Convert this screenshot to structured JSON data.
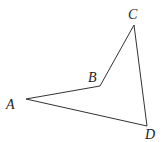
{
  "diagram": {
    "type": "quadrilateral",
    "stroke_color": "#333333",
    "vertices": [
      {
        "id": "A",
        "label": "A",
        "x": 26,
        "y": 99,
        "label_x": 6,
        "label_y": 109
      },
      {
        "id": "B",
        "label": "B",
        "x": 100,
        "y": 86,
        "label_x": 88,
        "label_y": 82
      },
      {
        "id": "C",
        "label": "C",
        "x": 134,
        "y": 25,
        "label_x": 128,
        "label_y": 19
      },
      {
        "id": "D",
        "label": "D",
        "x": 147,
        "y": 126,
        "label_x": 145,
        "label_y": 139
      }
    ],
    "edges": [
      [
        "A",
        "B"
      ],
      [
        "B",
        "C"
      ],
      [
        "C",
        "D"
      ],
      [
        "D",
        "A"
      ]
    ]
  }
}
